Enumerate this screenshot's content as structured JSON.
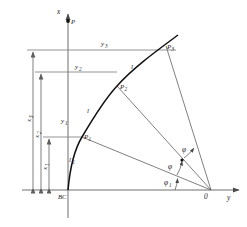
{
  "figure": {
    "axes": {
      "x_axis_label": "x",
      "y_axis_label": "y",
      "origin_label": "0",
      "baseline_label": "BC"
    },
    "points": [
      {
        "id": "P",
        "label": "P",
        "x": 62,
        "y": 18
      },
      {
        "id": "P1",
        "label": "P",
        "sub": "1",
        "x": 82,
        "y": 137
      },
      {
        "id": "P2",
        "label": "P",
        "sub": "2",
        "x": 117,
        "y": 86
      },
      {
        "id": "P3",
        "label": "P",
        "sub": "3",
        "x": 166,
        "y": 46
      }
    ],
    "ordinates": [
      {
        "id": "y1",
        "label": "y",
        "sub": "1"
      },
      {
        "id": "y2",
        "label": "y",
        "sub": "2"
      },
      {
        "id": "y3",
        "label": "y",
        "sub": "3"
      }
    ],
    "abscissas": [
      {
        "id": "x1",
        "label": "x",
        "sub": "1"
      },
      {
        "id": "x2",
        "label": "x",
        "sub": "2"
      },
      {
        "id": "x3",
        "label": "x",
        "sub": "3"
      }
    ],
    "segments": [
      {
        "id": "l1",
        "label": "l",
        "sub": "1"
      },
      {
        "id": "l2",
        "label": "l",
        "sub": ""
      },
      {
        "id": "l3",
        "label": "l",
        "sub": ""
      }
    ],
    "angles": [
      {
        "id": "phi1",
        "label": "φ",
        "sub": "1"
      },
      {
        "id": "phi2",
        "label": "φ",
        "sub": ""
      },
      {
        "id": "phi3",
        "label": "φ",
        "sub": ""
      }
    ],
    "colors": {
      "curve": "#111111",
      "axis": "#6e6e6e",
      "ray": "#555555",
      "dimension": "#5d5d5d",
      "text": "#1a1a1a",
      "background": "#ffffff"
    }
  }
}
